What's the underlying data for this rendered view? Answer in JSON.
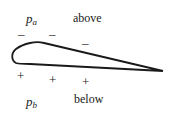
{
  "diagram": {
    "labels": {
      "pressure_above": {
        "base": "p",
        "sub": "a"
      },
      "pressure_below": {
        "base": "p",
        "sub": "b"
      },
      "above": "above",
      "below": "below"
    },
    "signs": {
      "upper": [
        "–",
        "–",
        "–"
      ],
      "lower": [
        "+",
        "+",
        "+"
      ]
    },
    "colors": {
      "stroke": "#1a1a1a",
      "background": "#ffffff"
    }
  }
}
